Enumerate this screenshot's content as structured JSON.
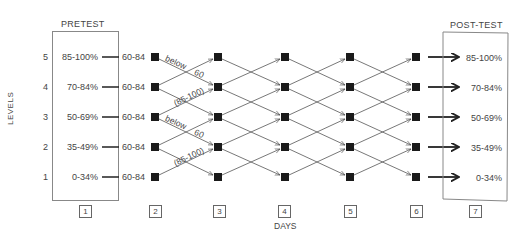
{
  "diagram": {
    "pretest_title": "PRETEST",
    "posttest_title": "POST-TEST",
    "y_axis_label": "LEVELS",
    "x_axis_label": "DAYS",
    "levels": [
      {
        "level": "5",
        "range": "85-100%",
        "start_score": "60-84"
      },
      {
        "level": "4",
        "range": "70-84%",
        "start_score": "60-84"
      },
      {
        "level": "3",
        "range": "50-69%",
        "start_score": "60-84"
      },
      {
        "level": "2",
        "range": "35-49%",
        "start_score": "60-84"
      },
      {
        "level": "1",
        "range": "0-34%",
        "start_score": "60-84"
      }
    ],
    "posttest_ranges": [
      "85-100%",
      "70-84%",
      "50-69%",
      "35-49%",
      "0-34%"
    ],
    "days": [
      "1",
      "2",
      "3",
      "4",
      "5",
      "6",
      "7"
    ],
    "annotations": {
      "below_a": "below",
      "sixty_a": "60",
      "range_a": "(85-100)",
      "below_b": "below",
      "sixty_b": "60",
      "range_b": "(85-100)"
    }
  }
}
